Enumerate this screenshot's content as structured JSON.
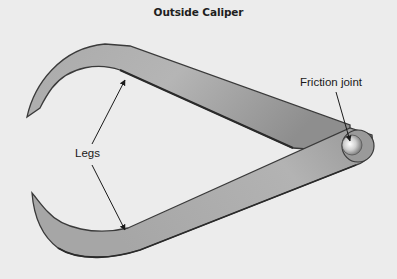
{
  "title": "Outside Caliper",
  "labels": {
    "friction_joint": "Friction joint",
    "legs": "Legs"
  },
  "colors": {
    "background": "#ececec",
    "metal_light": "#b8b8b8",
    "metal_dark": "#8a8a8a",
    "outline": "#3a3a3a",
    "text": "#1a1a1a"
  },
  "parts": [
    {
      "name": "upper leg"
    },
    {
      "name": "lower leg"
    },
    {
      "name": "friction joint"
    }
  ]
}
